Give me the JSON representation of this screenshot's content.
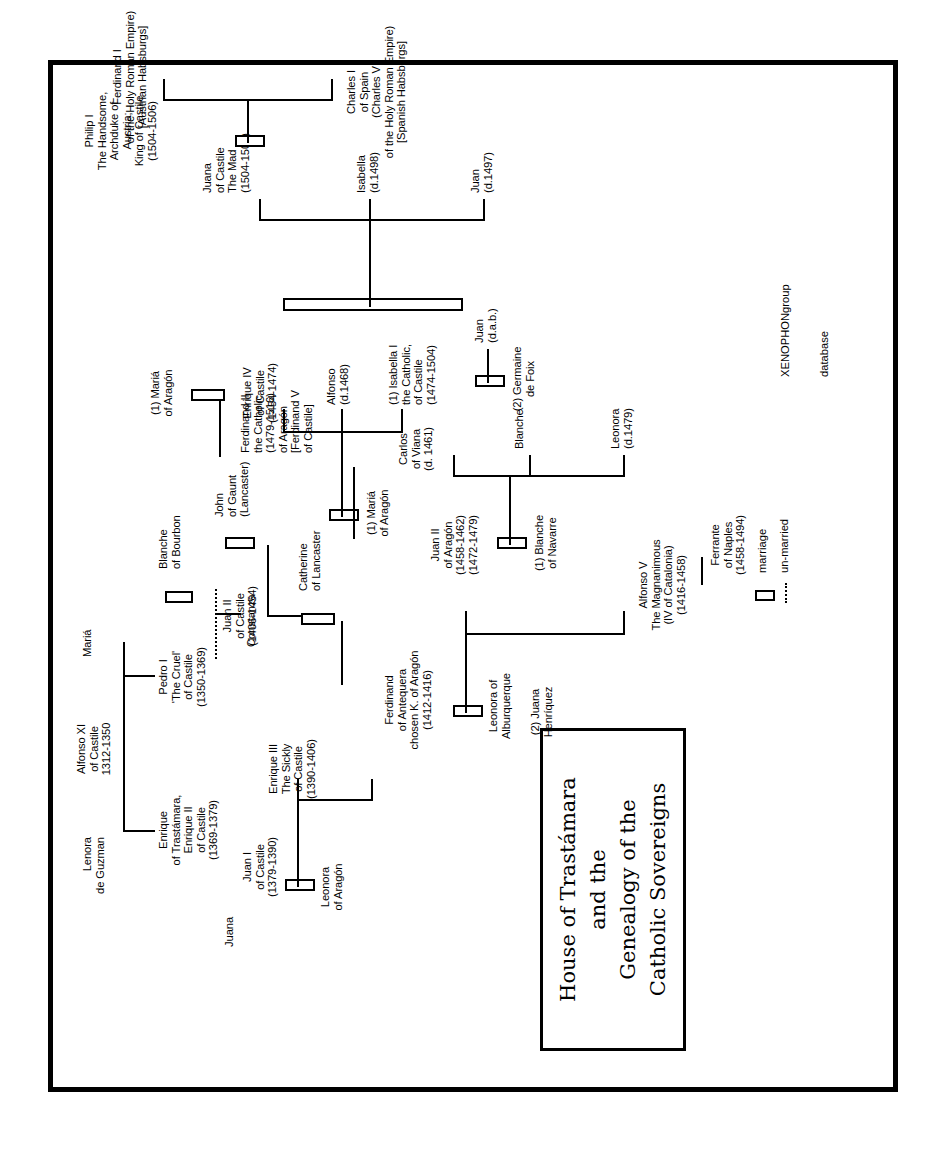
{
  "title": {
    "line1": "House of Trastámara",
    "line2": "and the",
    "line3": "Genealogy of the",
    "line4": "Catholic Sovereigns"
  },
  "legend": {
    "marriage_label": "marriage",
    "unmarried_label": "un-married",
    "marriage_icon": "marriage-bar-icon",
    "unmarried_icon": "dotted-line-icon"
  },
  "credit": {
    "line1": "XENOPHONgroup",
    "line2": "database"
  },
  "people": {
    "lenora_de_guzman": "Lenora\nde Guzman",
    "alfonso_xi": "Alfonso XI\nof Castile\n1312-1350",
    "maria_top": "Mariá",
    "juana_left": "Juana",
    "enrique_ii": "Enrique\nof Trastámara,\nEnrique II\nof Castile\n(1369-1379)",
    "pedro_i": "Pedro I\n'The Cruel'\nof Castile\n(1350-1369)",
    "blanche_bourbon": "Blanche\nof Bourbon",
    "constanza": "Constanza",
    "john_of_gaunt": "John\nof Gaunt\n(Lancaster)",
    "juan_i": "Juan I\nof Castile\n(1379-1390)",
    "leonora_aragon": "Leonora\nof Aragón",
    "enrique_iii": "Enrique III\nThe Sickly\nof Castile\n(1390-1406)",
    "catherine_lancaster": "Catherine\nof Lancaster",
    "ferdinand_antequera": "Ferdinand\nof Antequera\nchosen K. of Aragón\n(1412-1416)",
    "leonora_alburquerque": "Leonora of\nAlburquerque",
    "juan_ii_castile": "Juan II\nof Castile\n(1406-1454)",
    "maria_aragon_1": "(1) Mariá\nof Aragón",
    "maria_aragon_2": "(1) Mariá\nof Aragón",
    "enrique_iv": "Enrique IV\nof Castile\n(1454-1474)",
    "alfonso_d1468": "Alfonso\n(d.1468)",
    "isabella_i": "(1) Isabella I\nthe Catholic,\nof Castile\n(1474-1504)",
    "alfonso_v": "Alfonso V\nThe Magnanimous\n(IV of Catalonia)\n(1416-1458)",
    "ferrante_naples": "Ferrante\nof Naples\n(1458-1494)",
    "juan_ii_aragon": "Juan II\nof Aragón\n(1458-1462)\n(1472-1479)",
    "blanche_navarre": "(1) Blanche\nof Navarre",
    "juana_henriquez": "(2) Juana\nHenríquez",
    "leonora_d1479": "Leonora\n(d.1479)",
    "blanche": "Blanche",
    "carlos_viana": "Carlos\nof Viana\n(d. 1461)",
    "ferdinand_ii": "Ferdinand II\nthe Catholic\n(1479-1516)\nof Aragón\n[Ferdinand V\nof Castile]",
    "germaine_de_foix": "(2) Germaine\nde Foix",
    "juan_dab": "Juan\n(d.a.b.)",
    "juan_d1497": "Juan\n(d.1497)",
    "isabella_d1498": "Isabella\n(d.1498)",
    "juana_la_loca": "Juana\nof Castile\nThe Mad\n(1504-1506)",
    "philip_i": "Philip I\nThe Handsome,\nArchduke of\nAustria;\nKing of Castile\n(1504-1506)",
    "charles_i": "Charles I\nof Spain\n(Charles V\nof the Holy Roman Empire)\n[Spanish Habsburgs]",
    "ferdinand_i": "Ferdinand I\nof the Holy Roman Empire)\n[Austrian Habsburgs]"
  },
  "marks": {
    "question": "?"
  },
  "colors": {
    "ink": "#000000",
    "paper": "#ffffff"
  }
}
